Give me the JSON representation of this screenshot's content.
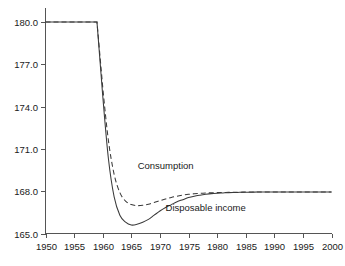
{
  "chart_data": {
    "type": "line",
    "title": "",
    "subtitle": "",
    "xlabel": "",
    "ylabel": "",
    "xlim": [
      1950,
      2000
    ],
    "ylim": [
      165.0,
      181.0
    ],
    "grid": false,
    "legend_position": "inline-annotation",
    "x_ticks": [
      1950,
      1955,
      1960,
      1965,
      1970,
      1975,
      1980,
      1985,
      1990,
      1995,
      2000
    ],
    "x_tick_labels": [
      "1950",
      "1955",
      "1960",
      "1965",
      "1970",
      "1975",
      "1980",
      "1985",
      "1990",
      "1995",
      "2000"
    ],
    "y_ticks": [
      165.0,
      168.0,
      171.0,
      174.0,
      177.0,
      180.0
    ],
    "y_tick_labels": [
      "165.0",
      "168.0",
      "171.0",
      "174.0",
      "177.0",
      "180.0"
    ],
    "x": [
      1950,
      1951,
      1952,
      1953,
      1954,
      1955,
      1956,
      1957,
      1958,
      1959,
      1960,
      1961,
      1962,
      1963,
      1964,
      1965,
      1966,
      1967,
      1968,
      1969,
      1970,
      1971,
      1972,
      1973,
      1974,
      1975,
      1976,
      1977,
      1978,
      1979,
      1980,
      1981,
      1982,
      1983,
      1984,
      1985,
      1986,
      1987,
      1988,
      1989,
      1990,
      1991,
      1992,
      1993,
      1994,
      1995,
      1996,
      1997,
      1998,
      1999,
      2000
    ],
    "series": [
      {
        "name": "Disposable income",
        "style": "solid",
        "color": "#3a3a3a",
        "annotation": "Disposable income",
        "values": [
          180.0,
          180.0,
          180.0,
          180.0,
          180.0,
          180.0,
          180.0,
          180.0,
          180.0,
          180.0,
          174.8,
          170.3,
          167.6,
          166.3,
          165.8,
          165.6,
          165.65,
          165.8,
          166.0,
          166.3,
          166.6,
          166.85,
          167.05,
          167.25,
          167.4,
          167.55,
          167.65,
          167.72,
          167.78,
          167.83,
          167.86,
          167.88,
          167.9,
          167.91,
          167.92,
          167.93,
          167.93,
          167.94,
          167.94,
          167.94,
          167.95,
          167.95,
          167.95,
          167.95,
          167.95,
          167.95,
          167.95,
          167.95,
          167.95,
          167.95,
          167.95
        ]
      },
      {
        "name": "Consumption",
        "style": "dashed",
        "color": "#3a3a3a",
        "annotation": "Consumption",
        "values": [
          180.0,
          180.0,
          180.0,
          180.0,
          180.0,
          180.0,
          180.0,
          180.0,
          180.0,
          180.0,
          175.4,
          171.6,
          169.2,
          167.9,
          167.3,
          167.05,
          166.98,
          167.0,
          167.08,
          167.2,
          167.33,
          167.45,
          167.56,
          167.65,
          167.72,
          167.78,
          167.82,
          167.85,
          167.87,
          167.89,
          167.9,
          167.91,
          167.92,
          167.93,
          167.93,
          167.94,
          167.94,
          167.94,
          167.95,
          167.95,
          167.95,
          167.95,
          167.95,
          167.95,
          167.95,
          167.95,
          167.95,
          167.95,
          167.95,
          167.95,
          167.95
        ]
      }
    ],
    "annotations": [
      {
        "text": "Consumption",
        "x": 1971,
        "y": 169.6
      },
      {
        "text": "Disposable income",
        "x": 1978,
        "y": 166.6
      }
    ]
  }
}
